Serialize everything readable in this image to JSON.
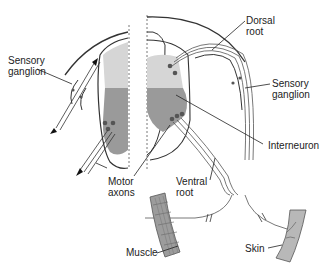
{
  "diagram": {
    "labels": {
      "sensory_ganglion_left": "Sensory\nganglion",
      "sensory_ganglion_left_l1": "Sensory",
      "sensory_ganglion_left_l2": "ganglion",
      "dorsal_root_l1": "Dorsal",
      "dorsal_root_l2": "root",
      "sensory_ganglion_right_l1": "Sensory",
      "sensory_ganglion_right_l2": "ganglion",
      "interneuron": "Interneuron",
      "motor_axons_l1": "Motor",
      "motor_axons_l2": "axons",
      "ventral_root_l1": "Ventral",
      "ventral_root_l2": "root",
      "muscle": "Muscle",
      "skin": "Skin"
    },
    "colors": {
      "dorsal_horn": "#d6d6d6",
      "ventral_horn": "#9a9a9a",
      "outline": "#333333",
      "neuron_dot": "#555555",
      "muscle": "#9c9c9c",
      "skin": "#b8b8b8"
    }
  }
}
